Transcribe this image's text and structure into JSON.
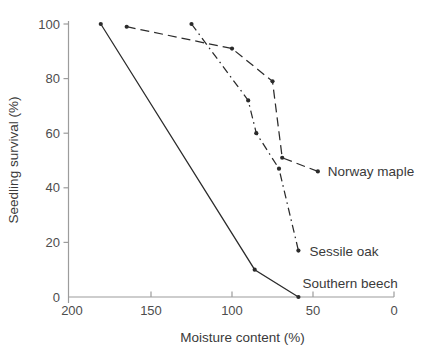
{
  "chart_data": {
    "type": "line",
    "title": "",
    "xlabel": "Moisture content (%)",
    "ylabel": "Seedling survival (%)",
    "x_ticks": [
      200,
      150,
      100,
      50,
      0
    ],
    "y_ticks": [
      0,
      20,
      40,
      60,
      80,
      100
    ],
    "xlim": [
      200,
      0
    ],
    "x_axis_reversed": true,
    "ylim": [
      0,
      100
    ],
    "grid": false,
    "legend": "inline-labels",
    "series": [
      {
        "name": "Southern beech",
        "line_style": "solid",
        "marker": "dot",
        "points": [
          [
            181,
            100
          ],
          [
            86,
            10
          ],
          [
            59,
            0
          ]
        ]
      },
      {
        "name": "Norway maple",
        "line_style": "long-dash",
        "marker": "dot",
        "points": [
          [
            165,
            99
          ],
          [
            100,
            91
          ],
          [
            75,
            79
          ],
          [
            69,
            51
          ],
          [
            47,
            46
          ]
        ]
      },
      {
        "name": "Sessile oak",
        "line_style": "dash-dot",
        "marker": "dot",
        "points": [
          [
            125,
            100
          ],
          [
            90,
            72
          ],
          [
            85,
            60
          ],
          [
            71,
            47
          ],
          [
            59,
            17
          ]
        ]
      }
    ],
    "colors": {
      "line": "#2b2b2b",
      "axis": "#9c9c9c",
      "tick_label": "#4d4d4d",
      "series_label": "#3a3a3a",
      "background": "#ffffff"
    }
  }
}
